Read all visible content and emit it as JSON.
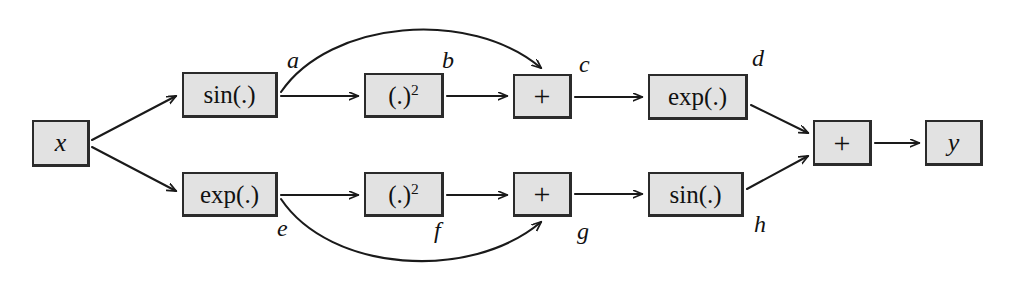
{
  "diagram": {
    "colors": {
      "node_fill": "#e2e2e2",
      "node_border": "#2b2b2b",
      "edge_stroke": "#1a1a1a",
      "background": "#ffffff"
    },
    "nodes": [
      {
        "id": "x",
        "label": "x",
        "kind": "var",
        "x": 32,
        "y": 120,
        "w": 58,
        "h": 47
      },
      {
        "id": "sin1",
        "label": "sin(.)",
        "kind": "fn",
        "x": 182,
        "y": 72,
        "w": 96,
        "h": 46
      },
      {
        "id": "sq1",
        "label": "(.)",
        "sup": "2",
        "kind": "pow",
        "x": 364,
        "y": 73,
        "w": 80,
        "h": 45
      },
      {
        "id": "plus1",
        "label": "+",
        "kind": "op",
        "x": 513,
        "y": 74,
        "w": 59,
        "h": 45
      },
      {
        "id": "exp1",
        "label": "exp(.)",
        "kind": "fn",
        "x": 648,
        "y": 74,
        "w": 100,
        "h": 46
      },
      {
        "id": "exp2",
        "label": "exp(.)",
        "kind": "fn",
        "x": 182,
        "y": 172,
        "w": 96,
        "h": 45
      },
      {
        "id": "sq2",
        "label": "(.)",
        "sup": "2",
        "kind": "pow",
        "x": 364,
        "y": 172,
        "w": 80,
        "h": 45
      },
      {
        "id": "plus2",
        "label": "+",
        "kind": "op",
        "x": 513,
        "y": 172,
        "w": 59,
        "h": 45
      },
      {
        "id": "sin2",
        "label": "sin(.)",
        "kind": "fn",
        "x": 648,
        "y": 172,
        "w": 96,
        "h": 45
      },
      {
        "id": "plus3",
        "label": "+",
        "kind": "op",
        "x": 813,
        "y": 120,
        "w": 59,
        "h": 46
      },
      {
        "id": "y",
        "label": "y",
        "kind": "var",
        "x": 925,
        "y": 120,
        "w": 58,
        "h": 46
      }
    ],
    "edge_labels": [
      {
        "id": "a",
        "text": "a",
        "x": 287,
        "y": 48
      },
      {
        "id": "b",
        "text": "b",
        "x": 442,
        "y": 48
      },
      {
        "id": "c",
        "text": "c",
        "x": 579,
        "y": 52
      },
      {
        "id": "d",
        "text": "d",
        "x": 752,
        "y": 46
      },
      {
        "id": "e",
        "text": "e",
        "x": 277,
        "y": 216
      },
      {
        "id": "f",
        "text": "f",
        "x": 434,
        "y": 218
      },
      {
        "id": "g",
        "text": "g",
        "x": 577,
        "y": 219
      },
      {
        "id": "h",
        "text": "h",
        "x": 754,
        "y": 212
      }
    ],
    "edges": [
      {
        "id": "x-to-sin1",
        "from": "x",
        "to": "sin1",
        "shape": "line",
        "d": "M 92,140 L 176,96"
      },
      {
        "id": "x-to-exp2",
        "from": "x",
        "to": "exp2",
        "shape": "line",
        "d": "M 92,147 L 176,191"
      },
      {
        "id": "sin1-to-sq1",
        "from": "sin1",
        "to": "sq1",
        "shape": "line",
        "d": "M 281,96 L 358,96"
      },
      {
        "id": "sin1-to-plus1",
        "from": "sin1",
        "to": "plus1",
        "shape": "curve",
        "d": "M 281,92 C 330,20 470,8 541,68"
      },
      {
        "id": "sq1-to-plus1",
        "from": "sq1",
        "to": "plus1",
        "shape": "line",
        "d": "M 447,96 L 507,96"
      },
      {
        "id": "plus1-to-exp1",
        "from": "plus1",
        "to": "exp1",
        "shape": "line",
        "d": "M 575,97 L 642,97"
      },
      {
        "id": "exp1-to-plus3",
        "from": "exp1",
        "to": "plus3",
        "shape": "line",
        "d": "M 751,105 L 808,133"
      },
      {
        "id": "exp2-to-sq2",
        "from": "exp2",
        "to": "sq2",
        "shape": "line",
        "d": "M 281,195 L 358,195"
      },
      {
        "id": "exp2-to-plus2",
        "from": "exp2",
        "to": "plus2",
        "shape": "curve",
        "d": "M 281,199 C 330,272 470,282 541,222"
      },
      {
        "id": "sq2-to-plus2",
        "from": "sq2",
        "to": "plus2",
        "shape": "line",
        "d": "M 447,195 L 507,195"
      },
      {
        "id": "plus2-to-sin2",
        "from": "plus2",
        "to": "sin2",
        "shape": "line",
        "d": "M 575,194 L 642,194"
      },
      {
        "id": "sin2-to-plus3",
        "from": "sin2",
        "to": "plus3",
        "shape": "line",
        "d": "M 747,189 L 808,156"
      },
      {
        "id": "plus3-to-y",
        "from": "plus3",
        "to": "y",
        "shape": "line",
        "d": "M 875,143 L 919,143"
      }
    ]
  }
}
